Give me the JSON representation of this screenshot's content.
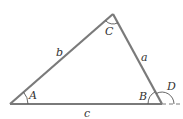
{
  "diagram": {
    "type": "triangle",
    "colors": {
      "side": "#7a7a7a",
      "arc": "#555555",
      "text": "#333333"
    },
    "vertices": {
      "A": {
        "x": 10,
        "y": 104
      },
      "B": {
        "x": 162,
        "y": 104
      },
      "C": {
        "x": 113,
        "y": 14
      }
    },
    "sides": {
      "a": {
        "label": "a",
        "between": [
          "B",
          "C"
        ]
      },
      "b": {
        "label": "b",
        "between": [
          "A",
          "C"
        ]
      },
      "c": {
        "label": "c",
        "between": [
          "A",
          "B"
        ]
      }
    },
    "angles": {
      "A": {
        "label": "A"
      },
      "B": {
        "label": "B"
      },
      "C": {
        "label": "C"
      },
      "D": {
        "label": "D",
        "type": "exterior",
        "at": "B"
      }
    },
    "extension": {
      "style": "dashed",
      "from": "B",
      "direction": "right"
    }
  }
}
